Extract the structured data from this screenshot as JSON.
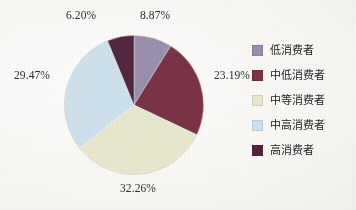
{
  "chart_data": {
    "type": "pie",
    "title": "",
    "subtitle": "",
    "xlabel": "",
    "ylabel": "",
    "legend_position": "right",
    "grid": false,
    "start_angle_deg": 0,
    "direction": "clockwise",
    "categories": [
      "低消费者",
      "中低消费者",
      "中等消费者",
      "中高消费者",
      "高消费者"
    ],
    "values": [
      8.87,
      23.19,
      32.26,
      29.47,
      6.2
    ],
    "value_labels": [
      "8.87%",
      "23.19%",
      "32.26%",
      "29.47%",
      "6.20%"
    ],
    "colors": [
      "#9b8fae",
      "#7d3246",
      "#e8e9cd",
      "#cfe2ee",
      "#54243f"
    ],
    "slices": [
      {
        "label": "低消费者",
        "value": 8.87,
        "display": "8.87%",
        "color": "#9b8fae"
      },
      {
        "label": "中低消费者",
        "value": 23.19,
        "display": "23.19%",
        "color": "#7d3246"
      },
      {
        "label": "中等消费者",
        "value": 32.26,
        "display": "32.26%",
        "color": "#e8e9cd"
      },
      {
        "label": "中高消费者",
        "value": 29.47,
        "display": "29.47%",
        "color": "#cfe2ee"
      },
      {
        "label": "高消费者",
        "value": 6.2,
        "display": "6.20%",
        "color": "#54243f"
      }
    ]
  },
  "legend": {
    "items": [
      {
        "label": "低消费者",
        "color": "#9b8fae"
      },
      {
        "label": "中低消费者",
        "color": "#7d3246"
      },
      {
        "label": "中等消费者",
        "color": "#e8e9cd"
      },
      {
        "label": "中高消费者",
        "color": "#cfe2ee"
      },
      {
        "label": "高消费者",
        "color": "#54243f"
      }
    ]
  }
}
